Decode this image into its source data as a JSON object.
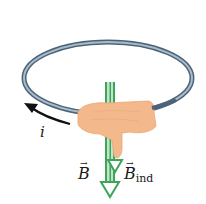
{
  "diagram": {
    "labels": {
      "current": "i",
      "field": "B",
      "induced_field_symbol": "B",
      "induced_field_subscript": "ind",
      "vector_arrow": "→"
    },
    "colors": {
      "background": "#ffffff",
      "loop_outer": "#4d6478",
      "loop_inner": "#a9bccc",
      "field_arrow": "#3fa35a",
      "field_arrow_light": "#bfe6c8",
      "hand": "#f3b98c",
      "current_arrow": "#111111"
    }
  }
}
